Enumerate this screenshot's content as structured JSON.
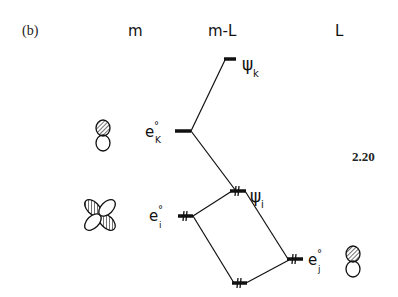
{
  "panel_label": "(b)",
  "columns": {
    "metal": "m",
    "complex": "m-L",
    "ligand": "L"
  },
  "figure_number": "2.20",
  "levels": {
    "psi_k": {
      "symbol": "ψ",
      "subscript": "k"
    },
    "e_k0": {
      "symbol": "e",
      "subscript": "K",
      "superscript": "°"
    },
    "psi_i": {
      "symbol": "ψ",
      "subscript": "i"
    },
    "e_i0": {
      "symbol": "e",
      "subscript": "i",
      "superscript": "°"
    },
    "e_j0": {
      "symbol": "e",
      "subscript": "j",
      "superscript": "°"
    }
  },
  "orbitals": {
    "metal_upper": "p-orbital (dumbbell, shaded top lobe)",
    "metal_lower": "d-orbital (four-lobed, two shaded)",
    "ligand": "p-orbital (dumbbell, shaded top lobe)"
  }
}
